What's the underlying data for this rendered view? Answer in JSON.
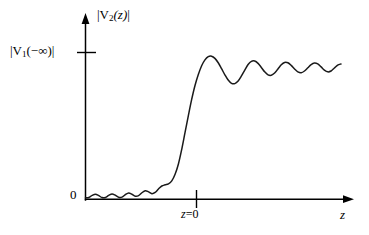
{
  "figure": {
    "background_color": "#ffffff",
    "line_color": "#1a1a1a",
    "axis_color": "#000000",
    "y_axis_title": "|V2(z)|",
    "y_axis_title_parts": {
      "pre": "|V",
      "sub": "2",
      "post": "(z)|"
    },
    "y_tick_label": "|V1(−∞)|",
    "y_tick_label_parts": {
      "pre": "|V",
      "sub": "1",
      "post": "(−∞)|"
    },
    "origin_label": "0",
    "x_tick_label": "z=0",
    "x_axis_label": "z"
  },
  "chart_data": {
    "type": "line",
    "title": "",
    "xlabel": "z",
    "ylabel": "|V2(z)|",
    "grid": false,
    "legend": null,
    "annotations": [
      {
        "text": "|V1(-∞)|",
        "axis": "y",
        "value": 1.0,
        "kind": "tick-label"
      },
      {
        "text": "z=0",
        "axis": "x",
        "value": 0.0,
        "kind": "tick-label"
      },
      {
        "text": "0",
        "axis": "origin",
        "value": 0.0,
        "kind": "origin-label"
      }
    ],
    "xlim": [
      -3.1,
      4.6
    ],
    "ylim": [
      0,
      1.22
    ],
    "x_ticks": [
      0.0
    ],
    "x_tick_labels": [
      "z=0"
    ],
    "y_ticks": [
      1.0
    ],
    "y_tick_labels": [
      "|V1(-∞)|"
    ],
    "series": [
      {
        "name": "|V2(z)|",
        "x": [
          -3.1,
          -3.0,
          -2.9,
          -2.8,
          -2.7,
          -2.6,
          -2.5,
          -2.4,
          -2.3,
          -2.2,
          -2.1,
          -2.0,
          -1.9,
          -1.8,
          -1.7,
          -1.6,
          -1.5,
          -1.4,
          -1.3,
          -1.2,
          -1.1,
          -1.0,
          -0.9,
          -0.8,
          -0.7,
          -0.6,
          -0.5,
          -0.4,
          -0.3,
          -0.2,
          -0.1,
          0.0,
          0.1,
          0.2,
          0.3,
          0.4,
          0.5,
          0.6,
          0.7,
          0.8,
          0.9,
          1.0,
          1.1,
          1.2,
          1.3,
          1.4,
          1.5,
          1.6,
          1.7,
          1.8,
          1.9,
          2.0,
          2.1,
          2.2,
          2.3,
          2.4,
          2.5,
          2.6,
          2.7,
          2.8,
          2.9,
          3.0,
          3.1,
          3.2,
          3.3,
          3.4,
          3.5,
          3.6,
          3.7,
          3.8,
          3.9,
          4.0,
          4.1,
          4.2,
          4.3,
          4.4,
          4.5,
          4.6
        ],
        "y": [
          0.01,
          0.012,
          0.026,
          0.034,
          0.024,
          0.011,
          0.012,
          0.026,
          0.036,
          0.027,
          0.013,
          0.014,
          0.031,
          0.043,
          0.034,
          0.02,
          0.024,
          0.044,
          0.058,
          0.05,
          0.038,
          0.046,
          0.07,
          0.09,
          0.098,
          0.105,
          0.125,
          0.17,
          0.24,
          0.34,
          0.455,
          0.57,
          0.68,
          0.775,
          0.85,
          0.91,
          0.95,
          0.972,
          0.975,
          0.96,
          0.93,
          0.89,
          0.848,
          0.812,
          0.79,
          0.788,
          0.806,
          0.84,
          0.88,
          0.918,
          0.94,
          0.942,
          0.926,
          0.898,
          0.868,
          0.848,
          0.845,
          0.86,
          0.888,
          0.916,
          0.932,
          0.93,
          0.912,
          0.888,
          0.868,
          0.862,
          0.874,
          0.896,
          0.918,
          0.928,
          0.922,
          0.902,
          0.88,
          0.868,
          0.874,
          0.894,
          0.914,
          0.922
        ]
      }
    ]
  }
}
